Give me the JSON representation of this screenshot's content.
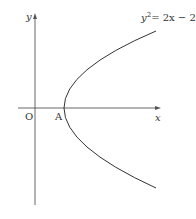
{
  "diagram": {
    "axes": {
      "x_label": "x",
      "y_label": "y",
      "origin_label": "O"
    },
    "points": [
      {
        "label": "A",
        "coords": [
          1,
          0
        ],
        "description": "vertex of parabola"
      }
    ],
    "curve": {
      "equation_lhs": "y",
      "equation_exp": "2",
      "equation_rhs": "= 2x − 2",
      "color": "#333333"
    },
    "colors": {
      "axis": "#555555",
      "curve": "#333333",
      "background": "#ffffff"
    }
  }
}
